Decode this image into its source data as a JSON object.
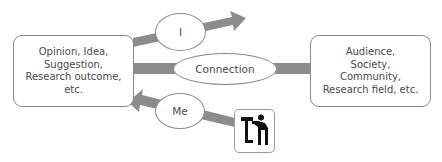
{
  "diagram": {
    "left_box": {
      "text": "Opinion, Idea,\nSuggestion,\nResearch outcome,\netc."
    },
    "right_box": {
      "text": "Audience,\nSociety,\nCommunity,\nResearch field, etc."
    },
    "top_ellipse": {
      "label": "I"
    },
    "middle_ellipse": {
      "label": "Connection"
    },
    "bottom_ellipse": {
      "label": "Me"
    },
    "icon": {
      "name": "telescope-viewer-icon"
    },
    "arrows": [
      {
        "id": "outgoing",
        "from": "left_box",
        "to": "top-right",
        "via": "I"
      },
      {
        "id": "connection",
        "from": "left_box",
        "to": "right_box",
        "via": "Connection"
      },
      {
        "id": "incoming",
        "from": "icon",
        "to": "left_box",
        "via": "Me"
      }
    ],
    "colors": {
      "arrow": "#8c8c8c",
      "border": "#8a8a8a",
      "text": "#4a4a4a"
    }
  }
}
